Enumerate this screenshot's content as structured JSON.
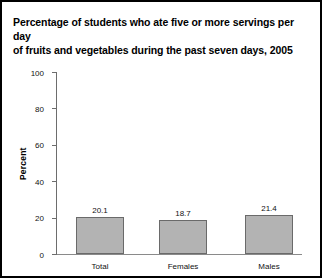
{
  "chart_data": {
    "type": "bar",
    "title": "Percentage of students who ate five or more servings per day of fruits and vegetables during the past seven days, 2005",
    "title_line1": "Percentage of students who ate five or more servings per day",
    "title_line2": "of fruits and vegetables during the past seven days, 2005",
    "categories": [
      "Total",
      "Females",
      "Males"
    ],
    "values": [
      20.1,
      18.7,
      21.4
    ],
    "value_labels": [
      "20.1",
      "18.7",
      "21.4"
    ],
    "xlabel": "",
    "ylabel": "Percent",
    "ylim": [
      0,
      100
    ],
    "yticks": [
      0,
      20,
      40,
      60,
      80,
      100
    ],
    "ytick_labels": [
      "0",
      "20",
      "40",
      "60",
      "80",
      "100"
    ],
    "grid": false,
    "legend": false,
    "bar_color": "#b3b3b3",
    "bar_edge_color": "#6a6a6a",
    "axis_color": "#6d6d6d",
    "text_color": "#111111",
    "border_color": "#000000",
    "background": "#ffffff"
  }
}
